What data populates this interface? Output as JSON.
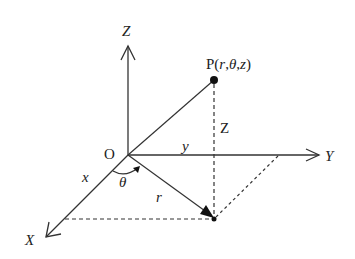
{
  "diagram": {
    "labels": {
      "z_axis": "Z",
      "y_axis": "Y",
      "x_axis": "X",
      "origin": "O",
      "point": "P(r,θ,z)",
      "point_prefix": "P(",
      "point_r": "r",
      "point_theta": "θ",
      "point_z": "z",
      "point_suffix": ")",
      "height": "Z",
      "x_seg": "x",
      "y_seg": "y",
      "radius": "r",
      "angle": "θ"
    },
    "colors": {
      "line": "#333333",
      "background": "#ffffff"
    }
  }
}
